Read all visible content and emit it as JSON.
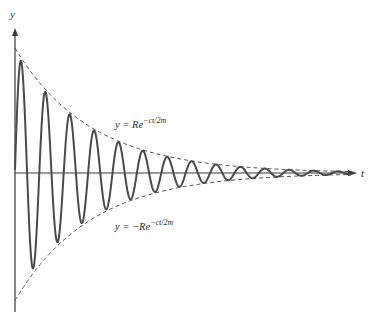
{
  "chart_data": {
    "type": "line",
    "title": "",
    "xlabel": "t",
    "ylabel": "y",
    "grid": false,
    "legend": null,
    "series": [
      {
        "name": "damped oscillation",
        "style": "solid",
        "color": "#555555",
        "amplitude_start": 1.0,
        "decay_rate_per_period": 0.32,
        "periods_shown": 14
      },
      {
        "name": "upper envelope",
        "label": "y = Re^{-ct/2m}",
        "style": "dashed",
        "color": "#555555"
      },
      {
        "name": "lower envelope",
        "label": "y = -Re^{-ct/2m}",
        "style": "dashed",
        "color": "#555555"
      }
    ],
    "annotations": [
      {
        "text_main": "y = Re",
        "text_exp": "−ct/2m",
        "position": "above curve, near x=115,y=127"
      },
      {
        "text_main": "y = −Re",
        "text_exp": "−ct/2m",
        "position": "below curve, near x=115,y=228"
      }
    ],
    "geometry": {
      "origin_px": [
        15,
        173
      ],
      "y_axis_top_px": 28,
      "y_axis_bottom_px": 312,
      "x_axis_end_px": 357,
      "amplitude_px": 125,
      "decay_k_per_px": 0.01323,
      "period_px": 24.4,
      "first_peak_x_px": 21
    }
  },
  "labels": {
    "y_axis": "y",
    "t_axis": "t",
    "upper_eq_main": "y = Re",
    "upper_eq_exp": "−ct/2m",
    "lower_eq_main": "y = −Re",
    "lower_eq_exp": "−ct/2m"
  },
  "colors": {
    "curve": "#4a4a4a",
    "axis": "#3a3a3a",
    "envelope": "#555555"
  }
}
